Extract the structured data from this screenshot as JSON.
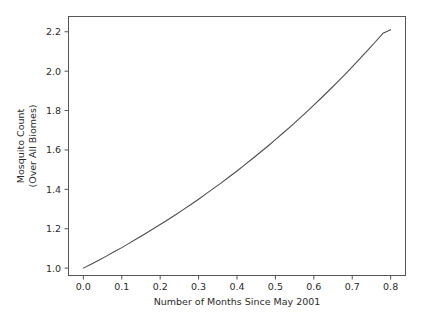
{
  "chart_data": {
    "type": "line",
    "title": "",
    "xlabel": "Number of Months Since May 2001",
    "ylabel_line1": "Mosquito Count",
    "ylabel_line2": "(Over All Biomes)",
    "xlim": [
      -0.04,
      0.84
    ],
    "ylim": [
      0.96,
      2.28
    ],
    "xticks": [
      0.0,
      0.1,
      0.2,
      0.3,
      0.4,
      0.5,
      0.6,
      0.7,
      0.8
    ],
    "xticklabels": [
      "0.0",
      "0.1",
      "0.2",
      "0.3",
      "0.4",
      "0.5",
      "0.6",
      "0.7",
      "0.8"
    ],
    "yticks": [
      1.0,
      1.2,
      1.4,
      1.6,
      1.8,
      2.0,
      2.2
    ],
    "yticklabels": [
      "1.0",
      "1.2",
      "1.4",
      "1.6",
      "1.8",
      "2.0",
      "2.2"
    ],
    "grid": false,
    "legend": false,
    "line_color": "#4d4d4d",
    "series": [
      {
        "name": "mosquito-count",
        "x": [
          0.0,
          0.02,
          0.04,
          0.06,
          0.08,
          0.1,
          0.12,
          0.14,
          0.16,
          0.18,
          0.2,
          0.22,
          0.24,
          0.26,
          0.28,
          0.3,
          0.32,
          0.34,
          0.36,
          0.38,
          0.4,
          0.42,
          0.44,
          0.46,
          0.48,
          0.5,
          0.52,
          0.54,
          0.56,
          0.58,
          0.6,
          0.62,
          0.64,
          0.66,
          0.68,
          0.7,
          0.72,
          0.74,
          0.76,
          0.78,
          0.8
        ],
        "y": [
          1.0,
          1.02,
          1.04,
          1.061,
          1.083,
          1.104,
          1.127,
          1.15,
          1.173,
          1.197,
          1.221,
          1.246,
          1.271,
          1.297,
          1.323,
          1.35,
          1.378,
          1.406,
          1.434,
          1.464,
          1.493,
          1.524,
          1.555,
          1.587,
          1.619,
          1.652,
          1.686,
          1.72,
          1.755,
          1.791,
          1.828,
          1.865,
          1.903,
          1.942,
          1.981,
          2.022,
          2.063,
          2.105,
          2.148,
          2.192,
          2.21
        ]
      }
    ]
  },
  "axes_geometry": {
    "left": 68,
    "right": 406,
    "top": 16,
    "bottom": 276
  }
}
